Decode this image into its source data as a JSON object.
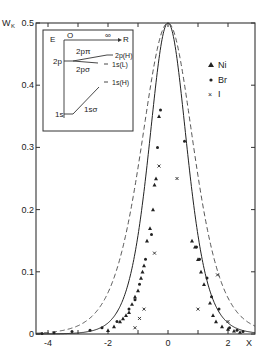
{
  "chart_data": {
    "type": "scatter",
    "title": "",
    "xlabel": "X",
    "ylabel": "W_K",
    "xlim": [
      -4.4,
      2.9
    ],
    "ylim": [
      0,
      0.5
    ],
    "x_ticks": [
      -4,
      -3,
      -2,
      -1,
      0,
      1,
      2
    ],
    "x_tick_labels": [
      "-4",
      "",
      "-2",
      "",
      "0",
      "",
      "2"
    ],
    "y_ticks": [
      0,
      0.1,
      0.2,
      0.3,
      0.4,
      0.5
    ],
    "y_tick_labels": [
      "0",
      "0.1",
      "0.2",
      "0.3",
      "0.4",
      "0.5"
    ],
    "grid": false,
    "legend_position": "upper right",
    "legend": [
      {
        "name": "Ni",
        "marker": "triangle"
      },
      {
        "name": "Br",
        "marker": "dot"
      },
      {
        "name": "I",
        "marker": "cross"
      }
    ],
    "curves": [
      {
        "name": "solid theory",
        "style": "solid",
        "peak": 0.5,
        "peak_x": 0,
        "half_width_left": 0.85,
        "half_width_right": 0.85
      },
      {
        "name": "dashed theory",
        "style": "dashed",
        "peak": 0.5,
        "peak_x": 0,
        "half_width_left": 1.2,
        "half_width_right": 1.15
      }
    ],
    "series": [
      {
        "name": "Ni",
        "x": [
          -2.0,
          -1.8,
          -1.6,
          -1.5,
          -1.4,
          -1.3,
          -1.2,
          -1.1,
          -1.0,
          -0.9,
          -0.85,
          -0.8,
          -0.7,
          -0.6,
          -0.5,
          -0.45,
          -0.4,
          -0.3,
          0.8,
          0.9,
          1.0,
          1.1,
          1.2,
          1.4,
          1.5,
          1.6,
          1.8,
          2.0,
          2.2,
          2.4
        ],
        "y": [
          0.006,
          0.012,
          0.02,
          0.025,
          0.03,
          0.035,
          0.048,
          0.06,
          0.07,
          0.09,
          0.1,
          0.11,
          0.15,
          0.17,
          0.2,
          0.24,
          0.25,
          0.35,
          0.15,
          0.14,
          0.12,
          0.1,
          0.08,
          0.05,
          0.03,
          0.02,
          0.012,
          0.008,
          0.005,
          0.003
        ]
      },
      {
        "name": "Br",
        "x": [
          -4.2,
          -3.8,
          -3.2,
          -2.6,
          -2.2,
          -1.7,
          -1.3,
          -1.1,
          -0.95,
          -0.75,
          -0.55,
          -0.35,
          -0.25,
          0.55,
          0.95,
          1.05,
          1.3,
          1.45,
          1.7,
          2.05,
          2.3,
          2.5
        ],
        "y": [
          0.001,
          0.002,
          0.004,
          0.006,
          0.01,
          0.02,
          0.04,
          0.055,
          0.08,
          0.12,
          0.16,
          0.3,
          0.36,
          0.31,
          0.14,
          0.12,
          0.09,
          0.06,
          0.04,
          0.01,
          0.006,
          0.004
        ]
      },
      {
        "name": "I",
        "x": [
          -1.1,
          -0.95,
          -0.8,
          -0.45,
          -0.3,
          0.3,
          1.0,
          1.65,
          2.0
        ],
        "y": [
          0.01,
          0.025,
          0.04,
          0.13,
          0.27,
          0.25,
          0.04,
          0.095,
          0.02
        ]
      }
    ],
    "inset": {
      "title": "energy level diagram",
      "axis_labels": {
        "y": "E",
        "x": "R",
        "x_start": "O",
        "x_end": "∞"
      },
      "levels_left": [
        "2p",
        "1s"
      ],
      "levels_right": [
        "2p(H)",
        "1s(L)",
        "1s(H)"
      ],
      "orbitals": [
        "2pπ",
        "2pσ",
        "1sσ"
      ]
    }
  }
}
